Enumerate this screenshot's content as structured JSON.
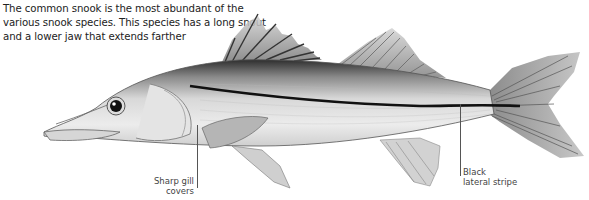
{
  "intro": {
    "text": "The common snook is the most abundant of the various snook species. This species has a long snout and a lower jaw that extends farther"
  },
  "illustration": {
    "subject": "common-snook-fish",
    "colors": {
      "body_light": "#e8e8e8",
      "body_mid": "#b5b5b5",
      "back_dark": "#3a3a3a",
      "stripe": "#111111",
      "fin": "#9a9a9a"
    }
  },
  "callouts": {
    "gill": {
      "label": "Sharp gill covers"
    },
    "stripe": {
      "label_line1": "Black",
      "label_line2": "lateral stripe"
    }
  }
}
